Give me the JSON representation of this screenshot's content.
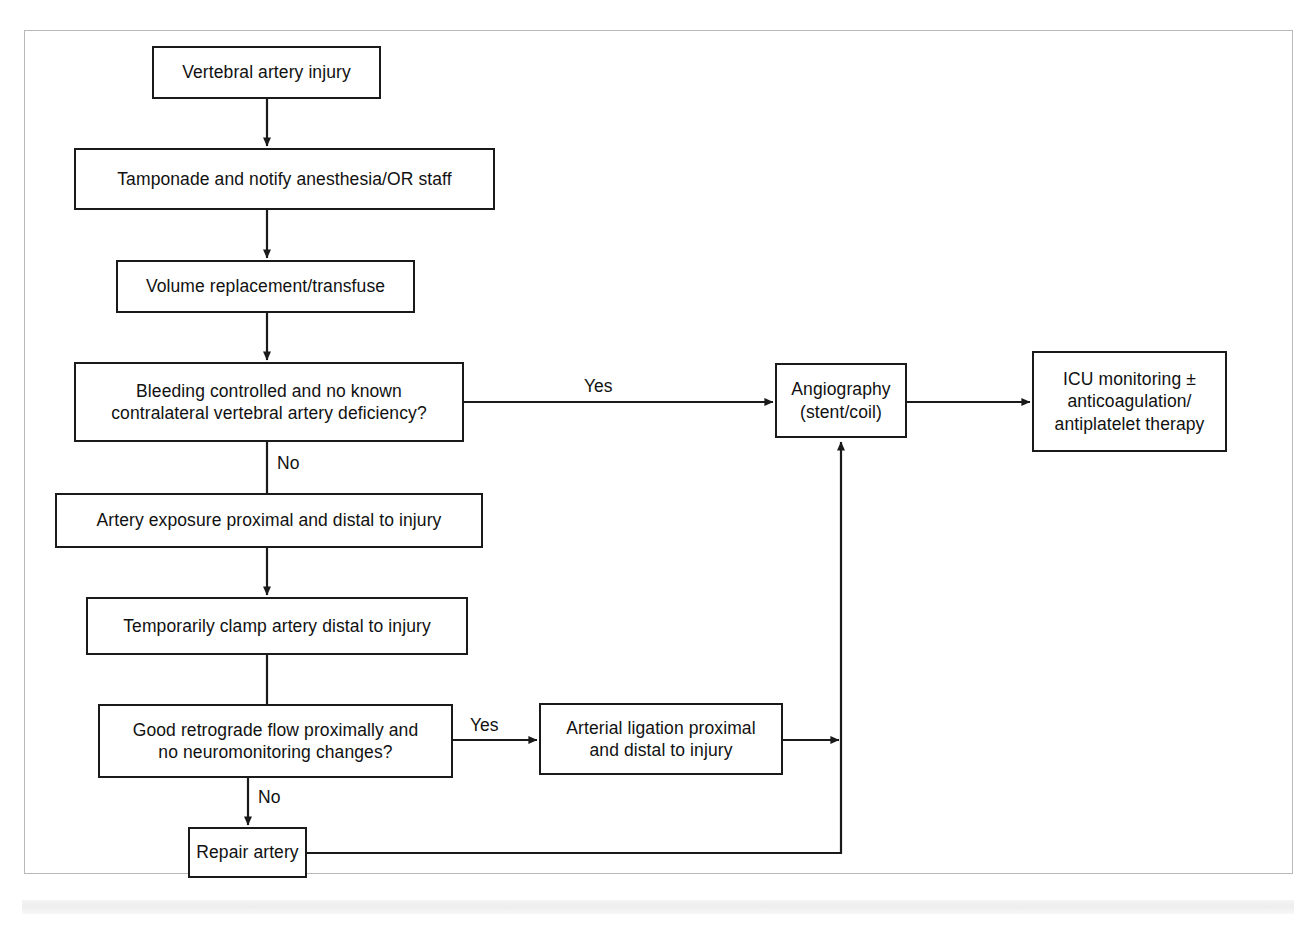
{
  "diagram": {
    "type": "flowchart",
    "frame_color": "#b9b9b9",
    "line_color": "#1a1a1a",
    "background": "#ffffff",
    "nodes": [
      {
        "id": "vertebral-artery-injury",
        "label": "Vertebral artery injury",
        "shape": "process"
      },
      {
        "id": "tamponade",
        "label": "Tamponade and notify anesthesia/OR staff",
        "shape": "process"
      },
      {
        "id": "volume-replacement",
        "label": "Volume replacement/transfuse",
        "shape": "process"
      },
      {
        "id": "bleeding-controlled",
        "label_line1": "Bleeding controlled and no known",
        "label_line2": "contralateral vertebral artery deficiency?",
        "shape": "decision"
      },
      {
        "id": "artery-exposure",
        "label": "Artery exposure proximal and distal to injury",
        "shape": "process"
      },
      {
        "id": "temporarily-clamp",
        "label": "Temporarily clamp artery distal to injury",
        "shape": "process"
      },
      {
        "id": "good-retrograde-flow",
        "label_line1": "Good retrograde flow proximally and",
        "label_line2": "no neuromonitoring changes?",
        "shape": "decision"
      },
      {
        "id": "repair-artery",
        "label": "Repair artery",
        "shape": "process"
      },
      {
        "id": "arterial-ligation",
        "label_line1": "Arterial ligation proximal",
        "label_line2": "and distal to injury",
        "shape": "process"
      },
      {
        "id": "angiography",
        "label_line1": "Angiography",
        "label_line2": "(stent/coil)",
        "shape": "process"
      },
      {
        "id": "icu-monitoring",
        "label_line1": "ICU monitoring ±",
        "label_line2": "anticoagulation/",
        "label_line3": "antiplatelet therapy",
        "shape": "process"
      }
    ],
    "edge_labels": {
      "bleeding_yes": "Yes",
      "bleeding_no": "No",
      "retrograde_yes": "Yes",
      "retrograde_no": "No"
    },
    "edges": [
      {
        "from": "vertebral-artery-injury",
        "to": "tamponade",
        "label": ""
      },
      {
        "from": "tamponade",
        "to": "volume-replacement",
        "label": ""
      },
      {
        "from": "volume-replacement",
        "to": "bleeding-controlled",
        "label": ""
      },
      {
        "from": "bleeding-controlled",
        "to": "angiography",
        "label": "Yes"
      },
      {
        "from": "bleeding-controlled",
        "to": "artery-exposure",
        "label": "No"
      },
      {
        "from": "artery-exposure",
        "to": "temporarily-clamp",
        "label": ""
      },
      {
        "from": "temporarily-clamp",
        "to": "good-retrograde-flow",
        "label": ""
      },
      {
        "from": "good-retrograde-flow",
        "to": "arterial-ligation",
        "label": "Yes"
      },
      {
        "from": "good-retrograde-flow",
        "to": "repair-artery",
        "label": "No"
      },
      {
        "from": "arterial-ligation",
        "to": "angiography",
        "label": ""
      },
      {
        "from": "repair-artery",
        "to": "angiography",
        "label": ""
      },
      {
        "from": "angiography",
        "to": "icu-monitoring",
        "label": ""
      }
    ]
  }
}
